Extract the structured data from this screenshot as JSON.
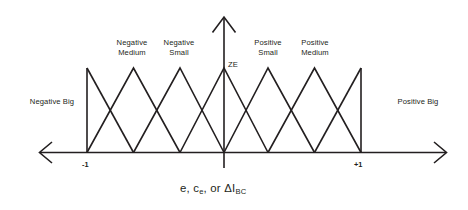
{
  "figure": {
    "kind": "fuzzy-membership-function-diagram",
    "axis_title": "e, c",
    "axis_title_sub1": "e",
    "axis_title_mid": ", or ΔI",
    "axis_title_sub2": "BC",
    "axis_title_full": "e, ce, or ΔIBC",
    "zero_label": "ZE",
    "ticks": [
      {
        "label": "-1",
        "value": -1
      },
      {
        "label": "+1",
        "value": 1
      }
    ],
    "sets": [
      {
        "id": "negative-big",
        "label": "Negative Big",
        "label_lines": [
          "Negative Big"
        ],
        "peak": -1.0
      },
      {
        "id": "negative-medium",
        "label": "Negative Medium",
        "label_lines": [
          "Negative",
          "Medium"
        ],
        "peak": -0.6667
      },
      {
        "id": "negative-small",
        "label": "Negative Small",
        "label_lines": [
          "Negative",
          "Small"
        ],
        "peak": -0.3333
      },
      {
        "id": "zero",
        "label": "ZE",
        "label_lines": [
          "ZE"
        ],
        "peak": 0.0
      },
      {
        "id": "positive-small",
        "label": "Positive Small",
        "label_lines": [
          "Positive",
          "Small"
        ],
        "peak": 0.3333
      },
      {
        "id": "positive-medium",
        "label": "Positive Medium",
        "label_lines": [
          "Positive",
          "Medium"
        ],
        "peak": 0.6667
      },
      {
        "id": "positive-big",
        "label": "Positive Big",
        "label_lines": [
          "Positive Big"
        ],
        "peak": 1.0
      }
    ],
    "colors": {
      "line": "#231f20",
      "text": "#231f20",
      "background": "#ffffff"
    }
  }
}
